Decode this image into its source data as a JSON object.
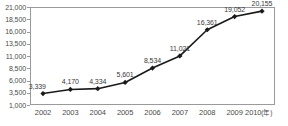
{
  "chart_data": {
    "type": "line",
    "title": "",
    "subtitle": "",
    "xlabel": "年",
    "ylabel": "",
    "categories": [
      "2002",
      "2003",
      "2004",
      "2005",
      "2006",
      "2007",
      "2008",
      "2009",
      "2010"
    ],
    "values": [
      3339,
      4170,
      4334,
      5601,
      8534,
      11021,
      16361,
      19052,
      20155
    ],
    "value_labels": [
      "3,339",
      "4,170",
      "4,334",
      "5,601",
      "8,534",
      "11,021",
      "16,361",
      "19,052",
      "20,155"
    ],
    "ylim": [
      1000,
      21000
    ],
    "y_ticks": [
      21000,
      18500,
      16000,
      13500,
      11000,
      8500,
      6000,
      3500,
      1000
    ],
    "y_tick_labels": [
      "21,000",
      "18,500",
      "16,000",
      "13,500",
      "11,000",
      "8,500",
      "6,000",
      "3,500",
      "1,000"
    ],
    "x_tick_labels": [
      "2002",
      "2003",
      "2004",
      "2005",
      "2006",
      "2007",
      "2008",
      "2009",
      "2010"
    ],
    "x_axis_unit_label": "(年)",
    "grid": false,
    "legend": false,
    "legend_position": "none",
    "series": [
      {
        "name": "",
        "values": [
          3339,
          4170,
          4334,
          5601,
          8534,
          11021,
          16361,
          19052,
          20155
        ],
        "color": "#1a1a1a",
        "marker": "diamond"
      }
    ],
    "colors": {
      "line": "#1a1a1a",
      "marker": "#111111",
      "axis": "#9a9a9a",
      "tick_text": "#4a4a4a",
      "label_text": "#3a3a3a",
      "background": "#ffffff"
    }
  }
}
